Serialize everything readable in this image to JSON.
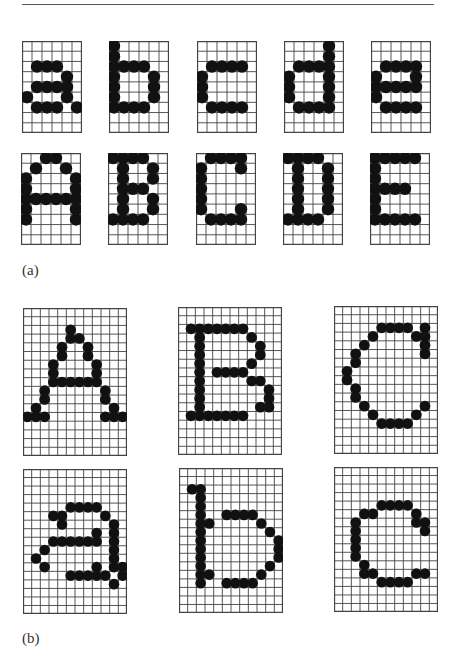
{
  "figure": {
    "section_a": {
      "label": "(a)",
      "grid_cols": 6,
      "grid_rows": 9,
      "rows": [
        {
          "name": "lowercase",
          "chars": [
            {
              "char": "a",
              "bitmap": [
                "......",
                "......",
                ".###..",
                "....#.",
                ".####.",
                "#...#.",
                ".###.#",
                "......",
                "......"
              ]
            },
            {
              "char": "b",
              "bitmap": [
                "#.....",
                "#.....",
                "####..",
                "#...#.",
                "#...#.",
                "#...#.",
                "####..",
                "......",
                "......"
              ]
            },
            {
              "char": "c",
              "bitmap": [
                "......",
                "......",
                ".####.",
                "#.....",
                "#.....",
                "#.....",
                ".####.",
                "......",
                "......"
              ]
            },
            {
              "char": "d",
              "bitmap": [
                "....#.",
                "....#.",
                ".####.",
                "#...#.",
                "#...#.",
                "#...#.",
                ".####.",
                "......",
                "......"
              ]
            },
            {
              "char": "e",
              "bitmap": [
                "......",
                "......",
                ".####.",
                "#...#.",
                "#####.",
                "#.....",
                ".####.",
                "......",
                "......"
              ]
            }
          ]
        },
        {
          "name": "uppercase",
          "chars": [
            {
              "char": "A",
              "bitmap": [
                "..##..",
                ".#..#.",
                "#....#",
                "#....#",
                "######",
                "#....#",
                "#....#",
                "......",
                "......"
              ]
            },
            {
              "char": "B",
              "bitmap": [
                "####..",
                ".#..#.",
                ".#..#.",
                ".###..",
                ".#..#.",
                ".#..#.",
                "####..",
                "......",
                "......"
              ]
            },
            {
              "char": "C",
              "bitmap": [
                ".####.",
                "#...#.",
                "#.....",
                "#.....",
                "#.....",
                "#...#.",
                ".####.",
                "......",
                "......"
              ]
            },
            {
              "char": "D",
              "bitmap": [
                "####..",
                ".#..#.",
                ".#..#.",
                ".#..#.",
                ".#..#.",
                ".#..#.",
                "####..",
                "......",
                "......"
              ]
            },
            {
              "char": "E",
              "bitmap": [
                "#####.",
                "#.....",
                "#.....",
                "####..",
                "#.....",
                "#.....",
                "#####.",
                "......",
                "......"
              ]
            }
          ]
        }
      ]
    },
    "section_b": {
      "label": "(b)",
      "grid_cols": 12,
      "grid_rows": 17,
      "rows": [
        {
          "name": "uppercase-high-res",
          "chars": [
            {
              "char": "A",
              "bitmap": [
                "............",
                "............",
                ".....#......",
                ".....##.....",
                "....#..#....",
                "....#..#....",
                "...#....#...",
                "...#....#...",
                "...######...",
                "..#......#..",
                "..#......#..",
                ".#........#.",
                "###......###",
                "............",
                "............",
                "............",
                "............"
              ]
            },
            {
              "char": "B",
              "bitmap": [
                "............",
                "............",
                ".#######....",
                "..#.....#...",
                "..#......#..",
                "..#......#..",
                "..#.....#...",
                "..#.####....",
                "..#.....##..",
                "..#.......#.",
                "..#.......#.",
                "..#......##.",
                ".#######....",
                "............",
                "............",
                "............",
                "............"
              ]
            },
            {
              "char": "C",
              "bitmap": [
                "............",
                "............",
                ".....####.#.",
                "....#....##.",
                "...#......#.",
                "..#.......#.",
                "..#.........",
                ".#..........",
                ".#..........",
                "..#.........",
                "..#.........",
                "...#......#.",
                "....#....#..",
                ".....####...",
                "............",
                "............",
                "............"
              ]
            }
          ]
        },
        {
          "name": "lowercase-high-res",
          "chars": [
            {
              "char": "a",
              "bitmap": [
                "............",
                "............",
                "............",
                "............",
                ".....####...",
                "...##....#..",
                "....#.....#.",
                "........#.#.",
                "...######.#.",
                "..#.......#.",
                ".#........#.",
                "..#.....#.##",
                ".....#####.#",
                "..........#.",
                "............",
                "............",
                "............"
              ]
            },
            {
              "char": "b",
              "bitmap": [
                "............",
                "............",
                ".##.........",
                "..#.........",
                "..#.........",
                "..#..####...",
                "..##.....#..",
                "..#.......#.",
                "..#........#",
                "..#........#",
                "..#........#",
                "..#.......#.",
                "..##.....#..",
                "..#..####...",
                "............",
                "............",
                "............"
              ]
            },
            {
              "char": "c",
              "bitmap": [
                "............",
                "............",
                "............",
                "............",
                ".....####...",
                "...##....#..",
                "..#......##.",
                "..#.......#.",
                "..#.........",
                "..#.........",
                "..#.........",
                "...#........",
                "...##....##.",
                ".....####...",
                "............",
                "............",
                "............"
              ]
            }
          ]
        }
      ]
    }
  }
}
